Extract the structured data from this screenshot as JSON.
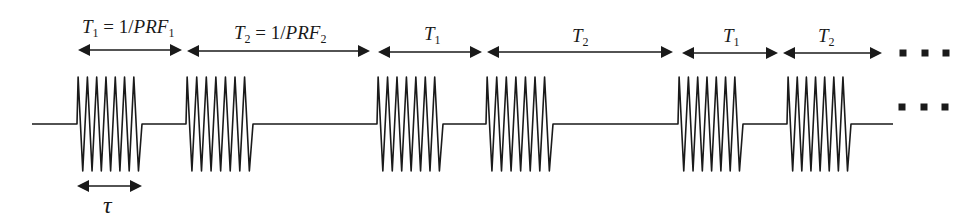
{
  "figure": {
    "colors": {
      "ink": "#1a1a1a",
      "background": "#ffffff"
    }
  },
  "labels": {
    "period1_full": {
      "main": "T",
      "sub1": "1",
      "eq": " = 1/",
      "var": "PRF",
      "sub2": "1"
    },
    "period2_full": {
      "main": "T",
      "sub1": "2",
      "eq": " = 1/",
      "var": "PRF",
      "sub2": "2"
    },
    "period1_short_a": {
      "main": "T",
      "sub1": "1"
    },
    "period2_short_a": {
      "main": "T",
      "sub1": "2"
    },
    "period1_short_b": {
      "main": "T",
      "sub1": "1"
    },
    "period2_short_b": {
      "main": "T",
      "sub1": "2"
    },
    "pulse_width": "τ"
  },
  "waveform": {
    "baseline_y": 124,
    "start_x": 32,
    "end_x": 893,
    "peak_y": 77,
    "trough_y": 171,
    "cycles_per_pulse": 7,
    "pulses": [
      {
        "start": 77,
        "end": 142
      },
      {
        "start": 186,
        "end": 253
      },
      {
        "start": 377,
        "end": 443
      },
      {
        "start": 486,
        "end": 553
      },
      {
        "start": 678,
        "end": 743
      },
      {
        "start": 787,
        "end": 851
      }
    ]
  },
  "period_arrows": [
    {
      "x1": 78,
      "x2": 182,
      "y": 50,
      "label": "T1 = 1/PRF1"
    },
    {
      "x1": 187,
      "x2": 370,
      "y": 51,
      "label": "T2 = 1/PRF2"
    },
    {
      "x1": 378,
      "x2": 482,
      "y": 52,
      "label": "T1"
    },
    {
      "x1": 487,
      "x2": 673,
      "y": 52,
      "label": "T2"
    },
    {
      "x1": 682,
      "x2": 778,
      "y": 53,
      "label": "T1"
    },
    {
      "x1": 783,
      "x2": 882,
      "y": 53,
      "label": "T2"
    }
  ],
  "tau_arrow": {
    "x1": 77,
    "x2": 142,
    "y": 186,
    "label": "τ"
  },
  "ellipsis": {
    "rows": [
      {
        "y": 53,
        "xs": [
          903,
          925,
          946
        ]
      },
      {
        "y": 107,
        "xs": [
          902,
          924,
          945
        ]
      }
    ],
    "size": 7
  }
}
